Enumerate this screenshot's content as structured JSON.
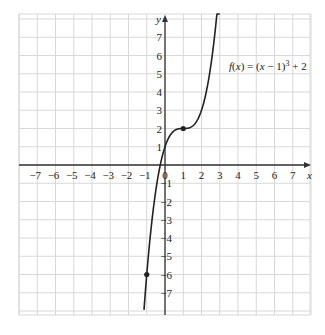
{
  "chart_data": {
    "type": "line",
    "title": "",
    "function_label": "f(x) = (x − 1)³ + 2",
    "xlabel": "x",
    "ylabel": "y",
    "xlim": [
      -8,
      8
    ],
    "ylim": [
      -8.2,
      8.2
    ],
    "x_ticks": [
      -7,
      -6,
      -5,
      -4,
      -3,
      -2,
      -1,
      0,
      1,
      2,
      3,
      4,
      5,
      6,
      7
    ],
    "y_ticks": [
      -7,
      -6,
      -5,
      -4,
      -3,
      -2,
      -1,
      1,
      2,
      3,
      4,
      5,
      6,
      7
    ],
    "grid": true,
    "series": [
      {
        "name": "f(x) = (x − 1)³ + 2",
        "formula": "(x-1)^3+2",
        "x_range": [
          -1.15,
          3.0
        ]
      }
    ],
    "points": [
      {
        "x": 1,
        "y": 2
      },
      {
        "x": -1,
        "y": -6
      }
    ]
  },
  "colors": {
    "grid": "#d8d8d8",
    "axis": "#333333",
    "curve": "#222222"
  }
}
